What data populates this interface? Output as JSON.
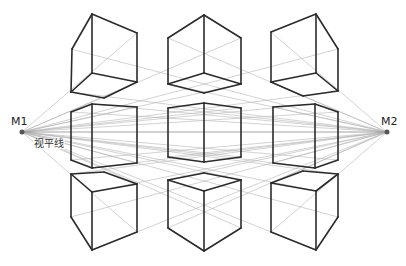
{
  "labels": {
    "m1": "M1",
    "m2": "M2",
    "horizon": "视平线"
  },
  "colors": {
    "background": "#ffffff",
    "cube_stroke": "#2b2b2b",
    "guide_stroke": "#b5b5b5",
    "horizon_stroke": "#8a8a8a",
    "vanishing_point": "#555555"
  },
  "vanishing_points": {
    "M1": [
      22,
      132
    ],
    "M2": [
      387,
      132
    ]
  },
  "horizon_y": 132,
  "cubes": [
    {
      "id": "top-left",
      "edges": [
        [
          [
            92,
            14
          ],
          [
            137,
            33
          ]
        ],
        [
          [
            92,
            14
          ],
          [
            72,
            49
          ]
        ],
        [
          [
            72,
            49
          ],
          [
            71,
            92
          ]
        ],
        [
          [
            137,
            33
          ],
          [
            137,
            82
          ]
        ],
        [
          [
            92,
            73
          ],
          [
            71,
            92
          ]
        ],
        [
          [
            92,
            73
          ],
          [
            137,
            82
          ]
        ],
        [
          [
            92,
            73
          ],
          [
            92,
            14
          ]
        ],
        [
          [
            71,
            92
          ],
          [
            104,
            98
          ]
        ],
        [
          [
            104,
            98
          ],
          [
            137,
            82
          ]
        ]
      ]
    },
    {
      "id": "top-center",
      "edges": [
        [
          [
            204,
            15
          ],
          [
            168,
            38
          ]
        ],
        [
          [
            204,
            15
          ],
          [
            241,
            38
          ]
        ],
        [
          [
            168,
            38
          ],
          [
            168,
            84
          ]
        ],
        [
          [
            241,
            38
          ],
          [
            241,
            84
          ]
        ],
        [
          [
            204,
            15
          ],
          [
            204,
            73
          ]
        ],
        [
          [
            204,
            73
          ],
          [
            168,
            84
          ]
        ],
        [
          [
            204,
            73
          ],
          [
            241,
            84
          ]
        ],
        [
          [
            168,
            84
          ],
          [
            204,
            93
          ]
        ],
        [
          [
            204,
            93
          ],
          [
            241,
            84
          ]
        ]
      ]
    },
    {
      "id": "top-right",
      "edges": [
        [
          [
            316,
            14
          ],
          [
            271,
            32
          ]
        ],
        [
          [
            316,
            14
          ],
          [
            338,
            49
          ]
        ],
        [
          [
            271,
            32
          ],
          [
            271,
            82
          ]
        ],
        [
          [
            338,
            49
          ],
          [
            338,
            91
          ]
        ],
        [
          [
            316,
            14
          ],
          [
            316,
            73
          ]
        ],
        [
          [
            316,
            73
          ],
          [
            271,
            82
          ]
        ],
        [
          [
            316,
            73
          ],
          [
            338,
            91
          ]
        ],
        [
          [
            271,
            82
          ],
          [
            303,
            96
          ]
        ],
        [
          [
            303,
            96
          ],
          [
            338,
            91
          ]
        ]
      ]
    },
    {
      "id": "middle-left",
      "edges": [
        [
          [
            71,
            112
          ],
          [
            92,
            104
          ]
        ],
        [
          [
            92,
            104
          ],
          [
            137,
            107
          ]
        ],
        [
          [
            71,
            160
          ],
          [
            92,
            168
          ]
        ],
        [
          [
            92,
            168
          ],
          [
            137,
            163
          ]
        ],
        [
          [
            71,
            112
          ],
          [
            71,
            160
          ]
        ],
        [
          [
            92,
            104
          ],
          [
            92,
            168
          ]
        ],
        [
          [
            137,
            107
          ],
          [
            137,
            163
          ]
        ]
      ]
    },
    {
      "id": "middle-center",
      "edges": [
        [
          [
            168,
            108
          ],
          [
            204,
            103
          ]
        ],
        [
          [
            204,
            103
          ],
          [
            241,
            108
          ]
        ],
        [
          [
            168,
            157
          ],
          [
            204,
            162
          ]
        ],
        [
          [
            204,
            162
          ],
          [
            241,
            157
          ]
        ],
        [
          [
            168,
            108
          ],
          [
            168,
            157
          ]
        ],
        [
          [
            204,
            103
          ],
          [
            204,
            162
          ]
        ],
        [
          [
            241,
            108
          ],
          [
            241,
            157
          ]
        ]
      ]
    },
    {
      "id": "middle-right",
      "edges": [
        [
          [
            273,
            107
          ],
          [
            315,
            104
          ]
        ],
        [
          [
            315,
            104
          ],
          [
            338,
            112
          ]
        ],
        [
          [
            273,
            163
          ],
          [
            315,
            168
          ]
        ],
        [
          [
            315,
            168
          ],
          [
            338,
            160
          ]
        ],
        [
          [
            273,
            107
          ],
          [
            273,
            163
          ]
        ],
        [
          [
            315,
            104
          ],
          [
            315,
            168
          ]
        ],
        [
          [
            338,
            112
          ],
          [
            338,
            160
          ]
        ]
      ]
    },
    {
      "id": "bottom-left",
      "edges": [
        [
          [
            71,
            174
          ],
          [
            104,
            172
          ]
        ],
        [
          [
            104,
            172
          ],
          [
            137,
            184
          ]
        ],
        [
          [
            71,
            174
          ],
          [
            92,
            192
          ]
        ],
        [
          [
            92,
            192
          ],
          [
            137,
            184
          ]
        ],
        [
          [
            71,
            174
          ],
          [
            71,
            217
          ]
        ],
        [
          [
            92,
            192
          ],
          [
            92,
            250
          ]
        ],
        [
          [
            137,
            184
          ],
          [
            137,
            232
          ]
        ],
        [
          [
            71,
            217
          ],
          [
            92,
            250
          ]
        ],
        [
          [
            92,
            250
          ],
          [
            137,
            232
          ]
        ]
      ]
    },
    {
      "id": "bottom-center",
      "edges": [
        [
          [
            168,
            180
          ],
          [
            204,
            173
          ]
        ],
        [
          [
            204,
            173
          ],
          [
            241,
            180
          ]
        ],
        [
          [
            168,
            180
          ],
          [
            204,
            191
          ]
        ],
        [
          [
            204,
            191
          ],
          [
            241,
            180
          ]
        ],
        [
          [
            168,
            180
          ],
          [
            168,
            228
          ]
        ],
        [
          [
            204,
            191
          ],
          [
            204,
            251
          ]
        ],
        [
          [
            241,
            180
          ],
          [
            241,
            228
          ]
        ],
        [
          [
            168,
            228
          ],
          [
            204,
            251
          ]
        ],
        [
          [
            204,
            251
          ],
          [
            241,
            228
          ]
        ]
      ]
    },
    {
      "id": "bottom-right",
      "edges": [
        [
          [
            271,
            183
          ],
          [
            303,
            171
          ]
        ],
        [
          [
            303,
            171
          ],
          [
            338,
            174
          ]
        ],
        [
          [
            271,
            183
          ],
          [
            316,
            191
          ]
        ],
        [
          [
            316,
            191
          ],
          [
            338,
            174
          ]
        ],
        [
          [
            271,
            183
          ],
          [
            271,
            232
          ]
        ],
        [
          [
            316,
            191
          ],
          [
            316,
            250
          ]
        ],
        [
          [
            338,
            174
          ],
          [
            338,
            217
          ]
        ],
        [
          [
            271,
            232
          ],
          [
            316,
            250
          ]
        ],
        [
          [
            316,
            250
          ],
          [
            338,
            217
          ]
        ]
      ]
    }
  ],
  "guide_targets": {
    "M1": [
      [
        137,
        33
      ],
      [
        137,
        82
      ],
      [
        241,
        38
      ],
      [
        241,
        84
      ],
      [
        338,
        49
      ],
      [
        338,
        91
      ],
      [
        137,
        107
      ],
      [
        137,
        163
      ],
      [
        241,
        108
      ],
      [
        241,
        157
      ],
      [
        338,
        112
      ],
      [
        338,
        160
      ],
      [
        137,
        184
      ],
      [
        137,
        232
      ],
      [
        241,
        180
      ],
      [
        241,
        228
      ],
      [
        338,
        174
      ],
      [
        338,
        217
      ],
      [
        315,
        104
      ],
      [
        315,
        168
      ],
      [
        316,
        191
      ],
      [
        316,
        250
      ]
    ],
    "M2": [
      [
        71,
        49
      ],
      [
        71,
        92
      ],
      [
        168,
        38
      ],
      [
        168,
        84
      ],
      [
        271,
        32
      ],
      [
        271,
        82
      ],
      [
        71,
        112
      ],
      [
        71,
        160
      ],
      [
        168,
        108
      ],
      [
        168,
        157
      ],
      [
        273,
        107
      ],
      [
        273,
        163
      ],
      [
        71,
        174
      ],
      [
        71,
        217
      ],
      [
        168,
        180
      ],
      [
        168,
        228
      ],
      [
        271,
        183
      ],
      [
        271,
        232
      ],
      [
        92,
        104
      ],
      [
        92,
        168
      ],
      [
        92,
        192
      ],
      [
        92,
        250
      ]
    ]
  }
}
